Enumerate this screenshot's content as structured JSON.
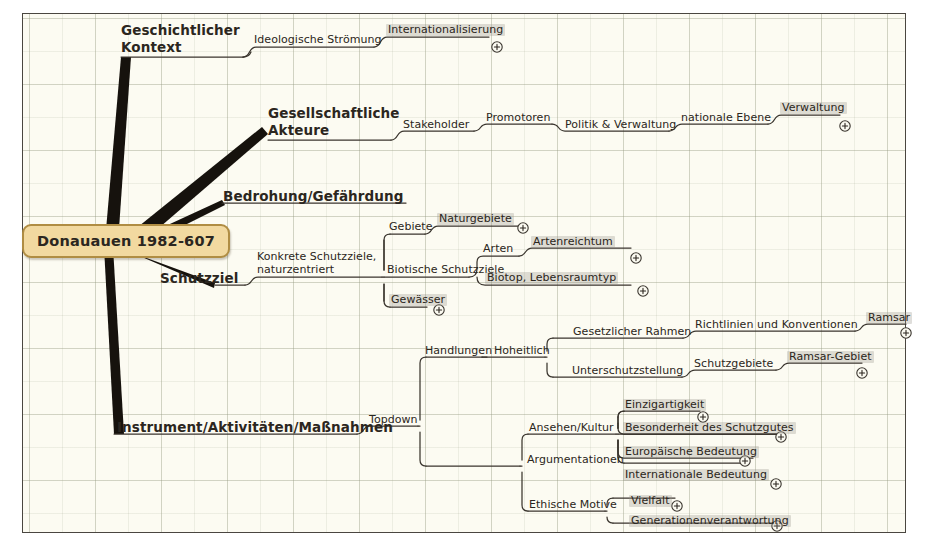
{
  "canvas": {
    "background": "#fcfbf2",
    "border_color": "#4a4640",
    "grid": "true"
  },
  "root": {
    "label": "Donauauen 1982-607",
    "fill": "#f2d9a0",
    "border": "#b08d43",
    "text": "#2b2620"
  },
  "icons": {
    "expand": "plus-circle-icon"
  },
  "branches": [
    {
      "id": "geschichtlicher-kontext",
      "label": "Geschichtlicher\nKontext",
      "line1": "Geschichtlicher",
      "line2": "Kontext",
      "children": [
        {
          "label": "Ideologische Strömung",
          "type": "mid"
        },
        {
          "label": "Internationalisierung",
          "type": "leaf",
          "expandable": "true"
        }
      ]
    },
    {
      "id": "gesellschaftliche-akteure",
      "label": "Gesellschaftliche\nAkteure",
      "line1": "Gesellschaftliche",
      "line2": "Akteure",
      "children": [
        {
          "label": "Stakeholder",
          "type": "mid"
        },
        {
          "label": "Promotoren",
          "type": "mid"
        },
        {
          "label": "Politik & Verwaltung",
          "type": "mid"
        },
        {
          "label": "nationale Ebene",
          "type": "mid"
        },
        {
          "label": "Verwaltung",
          "type": "leaf",
          "expandable": "true"
        }
      ]
    },
    {
      "id": "bedrohung-gefaehrdung",
      "label": "Bedrohung/Gefährdung",
      "line1": "Bedrohung/Gefährdung",
      "line2": "",
      "children": []
    },
    {
      "id": "schutzziel",
      "label": "Schutzziel",
      "line1": "Schutzziel",
      "line2": "",
      "children": [
        {
          "label": "Konkrete Schutzziele,\nnaturzentriert",
          "type": "mid"
        },
        {
          "label": "Gebiete",
          "type": "mid"
        },
        {
          "label": "Naturgebiete",
          "type": "leaf",
          "expandable": "true"
        },
        {
          "label": "Biotische Schutzziele",
          "type": "mid"
        },
        {
          "label": "Arten",
          "type": "mid"
        },
        {
          "label": "Artenreichtum",
          "type": "leaf",
          "expandable": "true"
        },
        {
          "label": "Biotop, Lebensraumtyp",
          "type": "leaf",
          "expandable": "true"
        },
        {
          "label": "Gewässer",
          "type": "leaf",
          "expandable": "true"
        }
      ]
    },
    {
      "id": "instrument-aktivitaeten-massnahmen",
      "label": "Instrument/Aktivitäten/Maßnahmen",
      "line1": "Instrument/Aktivitäten/Maßnahmen",
      "line2": "",
      "children": [
        {
          "label": "Topdown",
          "type": "mid"
        },
        {
          "label": "Handlungen",
          "type": "mid"
        },
        {
          "label": "Hoheitlich",
          "type": "mid"
        },
        {
          "label": "Gesetzlicher Rahmen",
          "type": "mid"
        },
        {
          "label": "Richtlinien und Konventionen",
          "type": "mid"
        },
        {
          "label": "Ramsar",
          "type": "leaf",
          "expandable": "true"
        },
        {
          "label": "Unterschutzstellung",
          "type": "mid"
        },
        {
          "label": "Schutzgebiete",
          "type": "mid"
        },
        {
          "label": "Ramsar-Gebiet",
          "type": "leaf",
          "expandable": "true"
        },
        {
          "label": "Argumentationen",
          "type": "mid"
        },
        {
          "label": "Ansehen/Kultur",
          "type": "mid"
        },
        {
          "label": "Einzigartigkeit",
          "type": "leaf",
          "expandable": "true"
        },
        {
          "label": "Besonderheit des Schutzgutes",
          "type": "leaf",
          "expandable": "true"
        },
        {
          "label": "Europäische Bedeutung",
          "type": "leaf",
          "expandable": "true"
        },
        {
          "label": "Internationale Bedeutung",
          "type": "leaf",
          "expandable": "true"
        },
        {
          "label": "Ethische Motive",
          "type": "mid"
        },
        {
          "label": "Vielfalt",
          "type": "leaf",
          "expandable": "true"
        },
        {
          "label": "Generationenverantwortung",
          "type": "leaf",
          "expandable": "true"
        }
      ]
    }
  ],
  "nodes": {
    "geschichtlicher_kontext_l1": "Geschichtlicher",
    "geschichtlicher_kontext_l2": "Kontext",
    "ideologische_stroemung": "Ideologische Strömung",
    "internationalisierung": "Internationalisierung",
    "gesellschaftliche_akteure_l1": "Gesellschaftliche",
    "gesellschaftliche_akteure_l2": "Akteure",
    "stakeholder": "Stakeholder",
    "promotoren": "Promotoren",
    "politik_verwaltung": "Politik & Verwaltung",
    "nationale_ebene": "nationale Ebene",
    "verwaltung": "Verwaltung",
    "bedrohung": "Bedrohung/Gefährdung",
    "schutzziel": "Schutzziel",
    "konkrete_l1": "Konkrete Schutzziele,",
    "konkrete_l2": "naturzentriert",
    "gebiete": "Gebiete",
    "naturgebiete": "Naturgebiete",
    "biotische_schutzziele": "Biotische Schutzziele",
    "arten": "Arten",
    "artenreichtum": "Artenreichtum",
    "biotop": "Biotop, Lebensraumtyp",
    "gewaesser": "Gewässer",
    "instrument": "Instrument/Aktivitäten/Maßnahmen",
    "topdown": "Topdown",
    "handlungen": "Handlungen",
    "hoheitlich": "Hoheitlich",
    "gesetzlicher_rahmen": "Gesetzlicher Rahmen",
    "richtlinien": "Richtlinien und Konventionen",
    "ramsar": "Ramsar",
    "unterschutzstellung": "Unterschutzstellung",
    "schutzgebiete": "Schutzgebiete",
    "ramsar_gebiet": "Ramsar-Gebiet",
    "argumentationen": "Argumentationen",
    "ansehen_kultur": "Ansehen/Kultur",
    "einzigartigkeit": "Einzigartigkeit",
    "besonderheit": "Besonderheit des Schutzgutes",
    "europaeische_bedeutung": "Europäische Bedeutung",
    "internationale_bedeutung": "Internationale Bedeutung",
    "ethische_motive": "Ethische Motive",
    "vielfalt": "Vielfalt",
    "generationenverantwortung": "Generationenverantwortung"
  }
}
